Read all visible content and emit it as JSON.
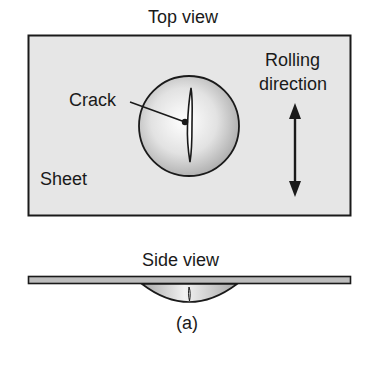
{
  "figure": {
    "label": "(a)",
    "colors": {
      "sheet_fill": "#e6e6e6",
      "outline": "#1a1a1a",
      "dome_center": "#ffffff",
      "dome_edge": "#a8a8a8",
      "bar_fill": "#bdbdbd"
    }
  },
  "top_view": {
    "title": "Top view",
    "sheet_label": "Sheet",
    "crack_label": "Crack",
    "rolling_direction_label_line1": "Rolling",
    "rolling_direction_label_line2": "direction"
  },
  "side_view": {
    "title": "Side view"
  }
}
